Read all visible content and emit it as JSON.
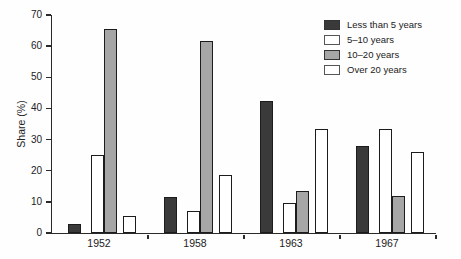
{
  "chart_data": {
    "type": "bar",
    "title": "",
    "xlabel": "",
    "ylabel": "Share (%)",
    "ylim": [
      0,
      70
    ],
    "yticks": [
      0,
      10,
      20,
      30,
      40,
      50,
      60,
      70
    ],
    "categories": [
      "1952",
      "1958",
      "1963",
      "1967"
    ],
    "series": [
      {
        "name": "Less than 5 years",
        "color": "#3a3a3a",
        "border": "#1c1c1c",
        "values": [
          3,
          11.5,
          42.5,
          28
        ]
      },
      {
        "name": "5–10 years",
        "color": "#ffffff",
        "border": "#1c1c1c",
        "values": [
          25,
          7,
          9.5,
          33.5
        ]
      },
      {
        "name": "10–20 years",
        "color": "#a6a6a6",
        "border": "#1c1c1c",
        "values": [
          65.5,
          61.5,
          13.5,
          12
        ]
      },
      {
        "name": "Over 20 years",
        "color": "#ffffff",
        "border": "#1c1c1c",
        "values": [
          5.5,
          18.5,
          33.5,
          26
        ]
      }
    ],
    "legend_position": "top-right",
    "grid": false
  }
}
